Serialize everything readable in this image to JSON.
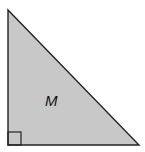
{
  "figure": {
    "shape": "right-triangle",
    "label": "M",
    "fill_color": "#c8c8c8",
    "stroke_color": "#222222",
    "vertices": [
      [
        8,
        10
      ],
      [
        8,
        145
      ],
      [
        139,
        145
      ]
    ],
    "right_angle_marker": {
      "x": 8,
      "y": 132,
      "size": 13
    }
  }
}
